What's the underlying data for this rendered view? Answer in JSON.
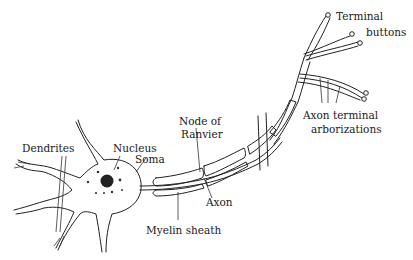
{
  "diagram": {
    "type": "neuron-anatomy",
    "labels": {
      "dendrites": "Dendrites",
      "nucleus": "Nucleus",
      "soma": "Soma",
      "node_line1": "Node of",
      "node_line2": "Ranvier",
      "axon": "Axon",
      "myelin": "Myelin sheath",
      "terminal_line1": "Terminal",
      "terminal_line2": "buttons",
      "arbor_line1": "Axon terminal",
      "arbor_line2": "arborizations"
    },
    "colors": {
      "ink": "#222222",
      "background": "#ffffff"
    }
  }
}
